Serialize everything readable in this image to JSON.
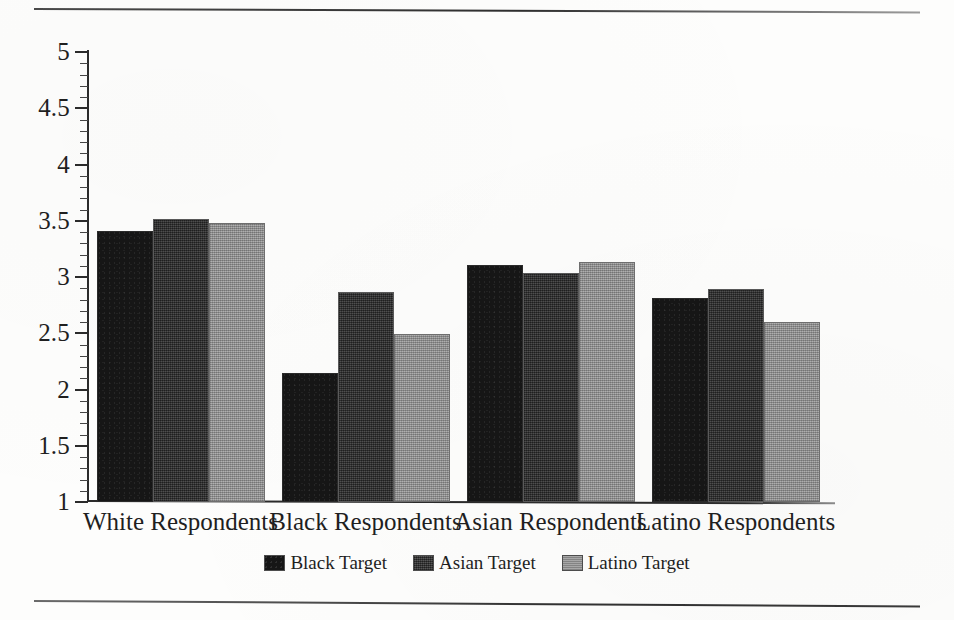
{
  "chart_data": {
    "type": "bar",
    "title": "",
    "subtitle": "",
    "xlabel": "",
    "ylabel": "",
    "categories": [
      "White Respondents",
      "Black Respondents",
      "Asian Respondents",
      "Latino Respondents"
    ],
    "series": [
      {
        "name": "Black Target",
        "color": "#161616",
        "values": [
          3.41,
          2.15,
          3.11,
          2.81
        ]
      },
      {
        "name": "Asian Target",
        "color": "#3a3a3a",
        "values": [
          3.52,
          2.87,
          3.04,
          2.89
        ]
      },
      {
        "name": "Latino Target",
        "color": "#9b9b9b",
        "values": [
          3.48,
          2.49,
          3.13,
          2.6
        ]
      }
    ],
    "ylim": [
      1,
      5
    ],
    "y_ticks": [
      "1",
      "1.5",
      "2",
      "2.5",
      "3",
      "3.5",
      "4",
      "4.5",
      "5"
    ],
    "y_tick_values": [
      1,
      1.5,
      2,
      2.5,
      3,
      3.5,
      4,
      4.5,
      5
    ],
    "y_minor_tick_step": 0.1,
    "grid": false,
    "legend_position": "bottom-center",
    "legend_entries": [
      "Black Target",
      "Asian Target",
      "Latino Target"
    ]
  },
  "figure": {
    "top_rule": "horizontal-rule",
    "bottom_rule": "horizontal-rule",
    "background": "#fdfdfc",
    "axis_color": "#2b2b2b"
  }
}
